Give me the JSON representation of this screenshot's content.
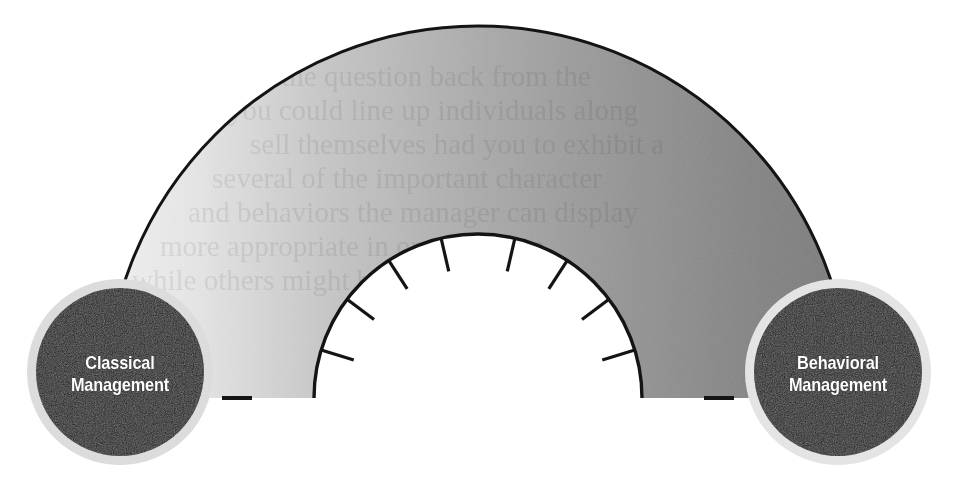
{
  "diagram": {
    "type": "continuum-gauge",
    "background_color": "#ffffff",
    "band": {
      "outline_color": "#000000",
      "gradient_from": "#ececec",
      "gradient_to": "#7d7d7d",
      "gradient_mid": "#a8a8a8",
      "start_angle_deg": 180,
      "end_angle_deg": 0,
      "outer_radius": 372,
      "inner_radius": 164,
      "center_x": 478,
      "center_y": 398
    },
    "scale": {
      "tick_color": "#000000",
      "tick_count": 8,
      "tick_angles_deg": [
        163,
        143,
        123,
        103,
        77,
        57,
        37,
        17
      ],
      "end_tick_angles_deg": [
        180,
        0
      ],
      "tick_length": 34,
      "end_tick_length": 30
    },
    "nodes": [
      {
        "id": "classical",
        "position": "left",
        "fill_color": "#111111",
        "ring_color": "#d9d9d9",
        "text_color": "#ffffff",
        "center_x": 120,
        "center_y": 372,
        "radius": 84,
        "ring_radius": 93,
        "label_lines": [
          "Classical",
          "Management"
        ]
      },
      {
        "id": "behavioral",
        "position": "right",
        "fill_color": "#111111",
        "ring_color": "#e2e2e2",
        "text_color": "#ffffff",
        "center_x": 838,
        "center_y": 372,
        "radius": 84,
        "ring_radius": 93,
        "label_lines": [
          "Behavioral",
          "Management"
        ]
      }
    ],
    "artifacts": {
      "description": "faint reverse-page show-through text visible inside the gray band",
      "opacity": 0.07,
      "lines": [
        "swers the question back from the",
        "you could line up individuals along",
        "sell themselves had you to exhibit a",
        "several of the important character",
        "and behaviors the manager can display",
        "more appropriate in one situation",
        "while others might be the best"
      ]
    }
  }
}
